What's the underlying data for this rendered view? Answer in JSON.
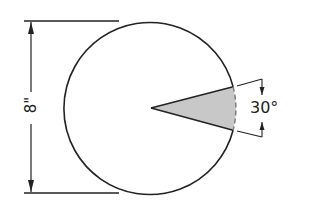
{
  "diagram": {
    "type": "circle-sector",
    "diameter_label": "8\"",
    "angle_label": "30°",
    "colors": {
      "stroke": "#222222",
      "sector_fill": "#c8c8c8",
      "background": "#ffffff"
    }
  }
}
